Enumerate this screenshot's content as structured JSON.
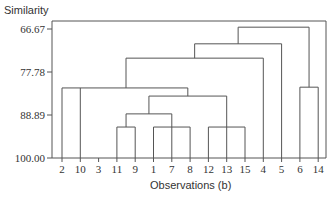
{
  "chart_data": {
    "type": "dendrogram",
    "title": "",
    "ylabel": "Similarity",
    "xlabel": "Observations (b)",
    "yticks": [
      "66.67",
      "77.78",
      "88.89",
      "100.00"
    ],
    "ylim": [
      100.0,
      64.0
    ],
    "leaf_order": [
      "2",
      "10",
      "3",
      "11",
      "9",
      "1",
      "7",
      "8",
      "12",
      "13",
      "15",
      "4",
      "5",
      "6",
      "14"
    ],
    "merges": [
      {
        "members": [
          "11",
          "9"
        ],
        "similarity": 92.0
      },
      {
        "members": [
          "1",
          "7",
          "8"
        ],
        "similarity": 92.0
      },
      {
        "members": [
          "12",
          "13",
          "15"
        ],
        "similarity": 92.0
      },
      {
        "members": [
          "{11,9}",
          "{1,7,8}"
        ],
        "similarity": 88.6
      },
      {
        "members": [
          "{11,9,1,7,8}",
          "{12,13,15}"
        ],
        "similarity": 84.0
      },
      {
        "members": [
          "2",
          "10",
          "{11,9,1,7,8,12,13,15}"
        ],
        "similarity": 81.9
      },
      {
        "members": [
          "6",
          "14"
        ],
        "similarity": 81.7
      },
      {
        "members": [
          "{2,10,...}",
          "4"
        ],
        "similarity": 74.2
      },
      {
        "members": [
          "{...,4}",
          "5"
        ],
        "similarity": 70.5
      },
      {
        "members": [
          "{...,5}",
          "{6,14}"
        ],
        "similarity": 66.2
      }
    ],
    "grid": false,
    "legend": null
  },
  "labels": {
    "ylabel": "Similarity",
    "xlabel": "Observations (b)"
  }
}
